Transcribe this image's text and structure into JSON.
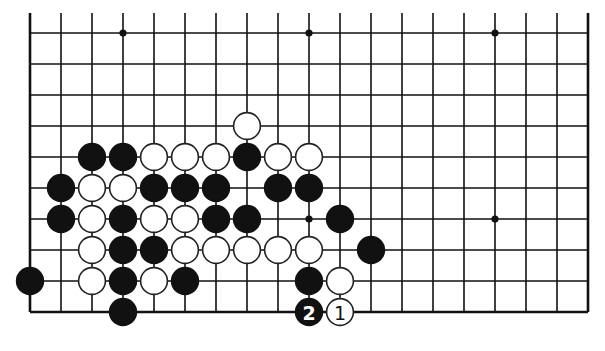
{
  "board": {
    "columns_visible": 19,
    "rows_visible": 10,
    "origin_x": 30,
    "origin_y": 33,
    "spacing": 31,
    "edges": {
      "left": true,
      "right": true,
      "bottom": true,
      "top": false
    },
    "colors": {
      "black": "#111111",
      "white": "#ffffff",
      "line": "#111111",
      "background": "#ffffff"
    },
    "hoshi": [
      {
        "c": 3,
        "r": 0
      },
      {
        "c": 9,
        "r": 0
      },
      {
        "c": 15,
        "r": 0
      },
      {
        "c": 9,
        "r": 6
      },
      {
        "c": 15,
        "r": 6
      }
    ],
    "stones": [
      {
        "c": 7,
        "r": 3,
        "color": "white"
      },
      {
        "c": 2,
        "r": 4,
        "color": "black"
      },
      {
        "c": 3,
        "r": 4,
        "color": "black"
      },
      {
        "c": 4,
        "r": 4,
        "color": "white"
      },
      {
        "c": 5,
        "r": 4,
        "color": "white"
      },
      {
        "c": 6,
        "r": 4,
        "color": "white"
      },
      {
        "c": 7,
        "r": 4,
        "color": "black"
      },
      {
        "c": 8,
        "r": 4,
        "color": "white"
      },
      {
        "c": 9,
        "r": 4,
        "color": "white"
      },
      {
        "c": 1,
        "r": 5,
        "color": "black"
      },
      {
        "c": 2,
        "r": 5,
        "color": "white"
      },
      {
        "c": 3,
        "r": 5,
        "color": "white"
      },
      {
        "c": 4,
        "r": 5,
        "color": "black"
      },
      {
        "c": 5,
        "r": 5,
        "color": "black"
      },
      {
        "c": 6,
        "r": 5,
        "color": "black"
      },
      {
        "c": 8,
        "r": 5,
        "color": "black"
      },
      {
        "c": 9,
        "r": 5,
        "color": "black"
      },
      {
        "c": 1,
        "r": 6,
        "color": "black"
      },
      {
        "c": 2,
        "r": 6,
        "color": "white"
      },
      {
        "c": 3,
        "r": 6,
        "color": "black"
      },
      {
        "c": 4,
        "r": 6,
        "color": "white"
      },
      {
        "c": 5,
        "r": 6,
        "color": "white"
      },
      {
        "c": 6,
        "r": 6,
        "color": "black"
      },
      {
        "c": 7,
        "r": 6,
        "color": "black"
      },
      {
        "c": 10,
        "r": 6,
        "color": "black"
      },
      {
        "c": 2,
        "r": 7,
        "color": "white"
      },
      {
        "c": 3,
        "r": 7,
        "color": "black"
      },
      {
        "c": 4,
        "r": 7,
        "color": "black"
      },
      {
        "c": 5,
        "r": 7,
        "color": "white"
      },
      {
        "c": 6,
        "r": 7,
        "color": "white"
      },
      {
        "c": 7,
        "r": 7,
        "color": "white"
      },
      {
        "c": 8,
        "r": 7,
        "color": "white"
      },
      {
        "c": 9,
        "r": 7,
        "color": "white"
      },
      {
        "c": 11,
        "r": 7,
        "color": "black"
      },
      {
        "c": 0,
        "r": 8,
        "color": "black"
      },
      {
        "c": 2,
        "r": 8,
        "color": "white"
      },
      {
        "c": 3,
        "r": 8,
        "color": "black"
      },
      {
        "c": 4,
        "r": 8,
        "color": "white"
      },
      {
        "c": 5,
        "r": 8,
        "color": "black"
      },
      {
        "c": 9,
        "r": 8,
        "color": "black"
      },
      {
        "c": 10,
        "r": 8,
        "color": "white"
      },
      {
        "c": 3,
        "r": 9,
        "color": "black"
      },
      {
        "c": 9,
        "r": 9,
        "color": "black",
        "label": "2"
      },
      {
        "c": 10,
        "r": 9,
        "color": "white",
        "label": "1"
      }
    ]
  }
}
